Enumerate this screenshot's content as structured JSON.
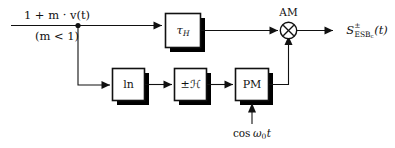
{
  "diagram": {
    "input": {
      "numerator": "1 + m · v(t)",
      "denominator": "(m < 1)"
    },
    "blocks": [
      {
        "id": "tau-h",
        "label": "τ",
        "sublabel": "H",
        "name": "delay-block"
      },
      {
        "id": "ln",
        "label": "ln",
        "name": "natural-log-block"
      },
      {
        "id": "hilbert",
        "label": "±ℋ",
        "name": "hilbert-transform-block"
      },
      {
        "id": "pm",
        "label": "PM",
        "name": "phase-modulator-block"
      }
    ],
    "multiplier": {
      "label": "AM",
      "symbol": "⊗"
    },
    "carrier": {
      "label_prefix": "cos",
      "label_symbol": "ω",
      "label_sub": "0",
      "label_suffix": "t",
      "full": "cos ω0t"
    },
    "output": {
      "base": "S",
      "superscript": "±",
      "subscript": "ESB",
      "subscript2": "c",
      "argument": "(t)",
      "full": "S±_ESBc(t)"
    },
    "colors": {
      "line": "#111111",
      "block_fill": "#ffffff",
      "shadow": "#000000",
      "background": "#ffffff"
    }
  }
}
